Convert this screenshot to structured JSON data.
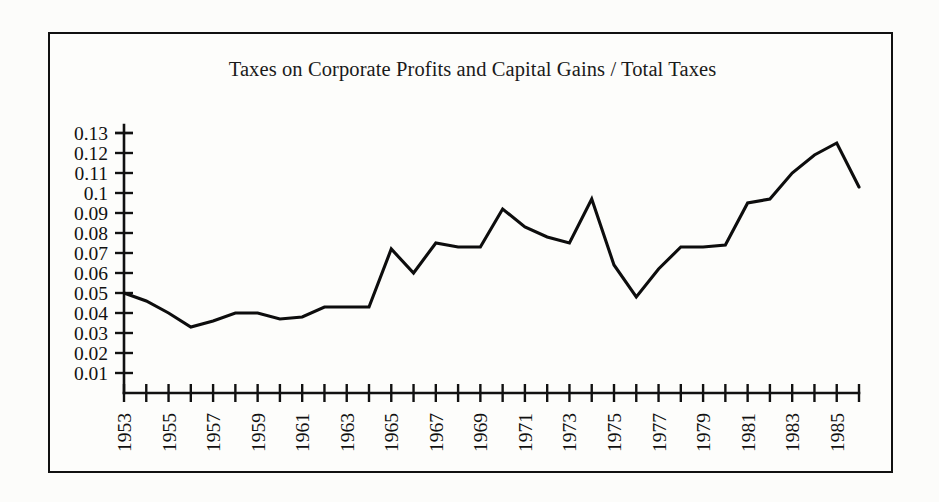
{
  "figure": {
    "background_color": "#fcfcfa",
    "frame_color": "#111111",
    "line_color": "#0d0d0d"
  },
  "chart_data": {
    "type": "line",
    "title": "Taxes on Corporate Profits and Capital Gains / Total Taxes",
    "xlabel": "",
    "ylabel": "",
    "xlim": [
      1953,
      1986
    ],
    "ylim": [
      0,
      0.13
    ],
    "grid": false,
    "legend": null,
    "y_tick_labels": [
      "0.13",
      "0.12",
      "0.11",
      "0.1",
      "0.09",
      "0.08",
      "0.07",
      "0.06",
      "0.05",
      "0.04",
      "0.03",
      "0.02",
      "0.01"
    ],
    "y_tick_values": [
      0.13,
      0.12,
      0.11,
      0.1,
      0.09,
      0.08,
      0.07,
      0.06,
      0.05,
      0.04,
      0.03,
      0.02,
      0.01
    ],
    "x_tick_labels": [
      "1953",
      "1955",
      "1957",
      "1959",
      "1961",
      "1963",
      "1965",
      "1967",
      "1969",
      "1971",
      "1973",
      "1975",
      "1977",
      "1979",
      "1981",
      "1983",
      "1985"
    ],
    "x_tick_values": [
      1953,
      1955,
      1957,
      1959,
      1961,
      1963,
      1965,
      1967,
      1969,
      1971,
      1973,
      1975,
      1977,
      1979,
      1981,
      1983,
      1985
    ],
    "x_minor_ticks_every": 1,
    "x": [
      1953,
      1954,
      1955,
      1956,
      1957,
      1958,
      1959,
      1960,
      1961,
      1962,
      1963,
      1964,
      1965,
      1966,
      1967,
      1968,
      1969,
      1970,
      1971,
      1972,
      1973,
      1974,
      1975,
      1976,
      1977,
      1978,
      1979,
      1980,
      1981,
      1982,
      1983,
      1984,
      1985,
      1986
    ],
    "values": [
      0.05,
      0.046,
      0.04,
      0.033,
      0.036,
      0.04,
      0.04,
      0.037,
      0.038,
      0.043,
      0.043,
      0.043,
      0.072,
      0.06,
      0.075,
      0.073,
      0.073,
      0.092,
      0.083,
      0.078,
      0.075,
      0.097,
      0.064,
      0.048,
      0.062,
      0.073,
      0.073,
      0.074,
      0.095,
      0.097,
      0.11,
      0.119,
      0.125,
      0.103
    ],
    "series_name": "Taxes on Corporate Profits and Capital Gains / Total Taxes"
  }
}
